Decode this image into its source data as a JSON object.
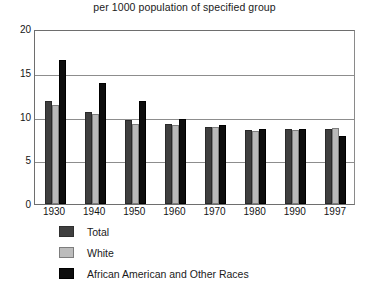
{
  "chart_data": {
    "type": "bar",
    "title": "per 1000 population of specified group",
    "xlabel": "",
    "ylabel": "",
    "ylim": [
      0,
      20
    ],
    "yticks": [
      0,
      5,
      10,
      15,
      20
    ],
    "grid": true,
    "legend_position": "bottom-left",
    "categories": [
      "1930",
      "1940",
      "1950",
      "1960",
      "1970",
      "1980",
      "1990",
      "1997"
    ],
    "series": [
      {
        "name": "Total",
        "color": "#3f3f3f",
        "values": [
          11.8,
          10.5,
          9.6,
          9.2,
          8.8,
          8.5,
          8.6,
          8.6
        ]
      },
      {
        "name": "White",
        "color": "#b9b9b9",
        "values": [
          11.3,
          10.3,
          9.2,
          9.0,
          8.8,
          8.4,
          8.5,
          8.7
        ]
      },
      {
        "name": "African American and Other Races",
        "color": "#0d0d0d",
        "values": [
          16.5,
          13.8,
          11.8,
          9.7,
          9.0,
          8.6,
          8.6,
          7.8
        ]
      }
    ]
  },
  "legend": {
    "items": [
      {
        "label": "Total"
      },
      {
        "label": "White"
      },
      {
        "label": "African American and Other Races"
      }
    ]
  }
}
